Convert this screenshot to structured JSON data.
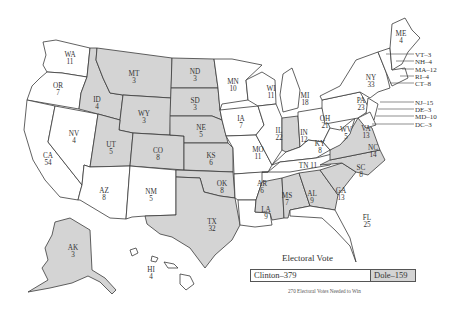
{
  "colors": {
    "clinton": "#ffffff",
    "dole": "#d4d4d4",
    "stroke": "#3a3a3a"
  },
  "states": [
    {
      "abbr": "WA",
      "votes": "11",
      "winner": "clinton"
    },
    {
      "abbr": "OR",
      "votes": "7",
      "winner": "clinton"
    },
    {
      "abbr": "CA",
      "votes": "54",
      "winner": "clinton"
    },
    {
      "abbr": "NV",
      "votes": "4",
      "winner": "clinton"
    },
    {
      "abbr": "ID",
      "votes": "4",
      "winner": "dole"
    },
    {
      "abbr": "MT",
      "votes": "3",
      "winner": "dole"
    },
    {
      "abbr": "WY",
      "votes": "3",
      "winner": "dole"
    },
    {
      "abbr": "UT",
      "votes": "5",
      "winner": "dole"
    },
    {
      "abbr": "AZ",
      "votes": "8",
      "winner": "clinton"
    },
    {
      "abbr": "CO",
      "votes": "8",
      "winner": "dole"
    },
    {
      "abbr": "NM",
      "votes": "5",
      "winner": "clinton"
    },
    {
      "abbr": "ND",
      "votes": "3",
      "winner": "dole"
    },
    {
      "abbr": "SD",
      "votes": "3",
      "winner": "dole"
    },
    {
      "abbr": "NE",
      "votes": "5",
      "winner": "dole"
    },
    {
      "abbr": "KS",
      "votes": "6",
      "winner": "dole"
    },
    {
      "abbr": "OK",
      "votes": "8",
      "winner": "dole"
    },
    {
      "abbr": "TX",
      "votes": "32",
      "winner": "dole"
    },
    {
      "abbr": "MN",
      "votes": "10",
      "winner": "clinton"
    },
    {
      "abbr": "IA",
      "votes": "7",
      "winner": "clinton"
    },
    {
      "abbr": "MO",
      "votes": "11",
      "winner": "clinton"
    },
    {
      "abbr": "AR",
      "votes": "6",
      "winner": "clinton"
    },
    {
      "abbr": "LA",
      "votes": "9",
      "winner": "clinton"
    },
    {
      "abbr": "WI",
      "votes": "11",
      "winner": "clinton"
    },
    {
      "abbr": "IL",
      "votes": "22",
      "winner": "clinton"
    },
    {
      "abbr": "MI",
      "votes": "18",
      "winner": "clinton"
    },
    {
      "abbr": "IN",
      "votes": "12",
      "winner": "dole"
    },
    {
      "abbr": "OH",
      "votes": "21",
      "winner": "clinton"
    },
    {
      "abbr": "KY",
      "votes": "8",
      "winner": "clinton"
    },
    {
      "abbr": "TN",
      "votes": "11",
      "winner": "clinton"
    },
    {
      "abbr": "MS",
      "votes": "7",
      "winner": "dole"
    },
    {
      "abbr": "AL",
      "votes": "9",
      "winner": "dole"
    },
    {
      "abbr": "GA",
      "votes": "13",
      "winner": "dole"
    },
    {
      "abbr": "FL",
      "votes": "25",
      "winner": "clinton"
    },
    {
      "abbr": "SC",
      "votes": "8",
      "winner": "dole"
    },
    {
      "abbr": "NC",
      "votes": "14",
      "winner": "dole"
    },
    {
      "abbr": "VA",
      "votes": "13",
      "winner": "dole"
    },
    {
      "abbr": "WV",
      "votes": "5",
      "winner": "clinton"
    },
    {
      "abbr": "PA",
      "votes": "23",
      "winner": "clinton"
    },
    {
      "abbr": "NY",
      "votes": "33",
      "winner": "clinton"
    },
    {
      "abbr": "ME",
      "votes": "4",
      "winner": "clinton"
    },
    {
      "abbr": "AK",
      "votes": "3",
      "winner": "dole"
    },
    {
      "abbr": "HI",
      "votes": "4",
      "winner": "clinton"
    }
  ],
  "side_labels": [
    {
      "text": "VT–3"
    },
    {
      "text": "NH–4"
    },
    {
      "text": "MA–12"
    },
    {
      "text": "RI–4"
    },
    {
      "text": "CT–8"
    },
    {
      "text": "NJ–15"
    },
    {
      "text": "DE–3"
    },
    {
      "text": "MD–10"
    },
    {
      "text": "DC–3"
    }
  ],
  "inline_labels": {
    "tn": "TN 11"
  },
  "legend": {
    "title": "Electoral Vote",
    "clinton_label": "Clinton–379",
    "dole_label": "Dole–159",
    "footnote": "270 Electoral Votes Needed to Win"
  }
}
